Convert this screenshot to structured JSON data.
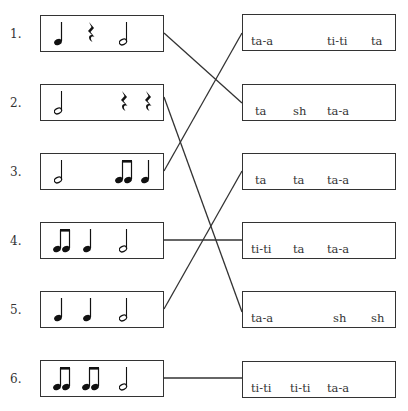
{
  "worksheet": {
    "rows": [
      {
        "number": "1.",
        "left_notes": [
          "quarter",
          "quarter-rest",
          "half"
        ],
        "right_syllables": [
          "ta-a",
          "ti-ti",
          "ta"
        ]
      },
      {
        "number": "2.",
        "left_notes": [
          "half",
          "quarter-rest",
          "quarter-rest"
        ],
        "right_syllables": [
          "ta",
          "sh",
          "ta-a"
        ]
      },
      {
        "number": "3.",
        "left_notes": [
          "half",
          "eighth-pair",
          "quarter"
        ],
        "right_syllables": [
          "ta",
          "ta",
          "ta-a"
        ]
      },
      {
        "number": "4.",
        "left_notes": [
          "eighth-pair",
          "quarter",
          "half"
        ],
        "right_syllables": [
          "ti-ti",
          "ta",
          "ta-a"
        ]
      },
      {
        "number": "5.",
        "left_notes": [
          "quarter",
          "quarter",
          "half"
        ],
        "right_syllables": [
          "ta-a",
          "sh",
          "sh"
        ]
      },
      {
        "number": "6.",
        "left_notes": [
          "eighth-pair",
          "eighth-pair",
          "half"
        ],
        "right_syllables": [
          "ti-ti",
          "ti-ti",
          "ta-a"
        ]
      }
    ],
    "matches": [
      {
        "left": 1,
        "right": 2
      },
      {
        "left": 2,
        "right": 5
      },
      {
        "left": 3,
        "right": 1
      },
      {
        "left": 4,
        "right": 4
      },
      {
        "left": 5,
        "right": 3
      },
      {
        "left": 6,
        "right": 6
      }
    ]
  }
}
